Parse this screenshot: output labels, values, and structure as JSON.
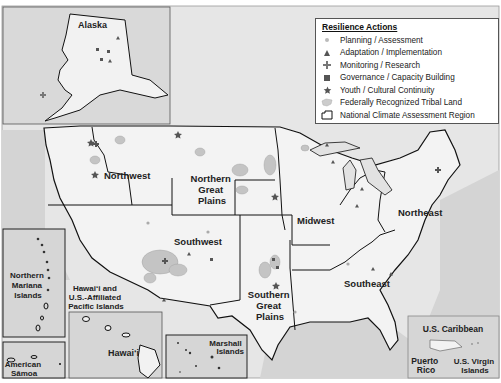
{
  "legend": {
    "title": "Resilience Actions",
    "items": [
      {
        "label": "Planning / Assessment",
        "icon": "circle-icon"
      },
      {
        "label": "Adaptation / Implementation",
        "icon": "triangle-icon"
      },
      {
        "label": "Monitoring / Research",
        "icon": "plus-icon"
      },
      {
        "label": "Governance / Capacity Building",
        "icon": "square-icon"
      },
      {
        "label": "Youth / Cultural Continuity",
        "icon": "star-icon"
      },
      {
        "label": "Federally Recognized Tribal Land",
        "icon": "tribal-land-icon"
      },
      {
        "label": "National Climate Assessment Region",
        "icon": "region-outline-icon"
      }
    ]
  },
  "regions": {
    "northwest": "Northwest",
    "northern_great_plains": [
      "Northern",
      "Great",
      "Plains"
    ],
    "midwest": "Midwest",
    "northeast": "Northeast",
    "southwest": "Southwest",
    "southern_great_plains": [
      "Southern",
      "Great",
      "Plains"
    ],
    "southeast": "Southeast"
  },
  "insets": {
    "alaska": "Alaska",
    "northern_mariana": [
      "Northern",
      "Mariana",
      "Islands"
    ],
    "american_samoa": [
      "American",
      "Sāmoa"
    ],
    "hawaii_pacific": [
      "Hawai‘i and",
      "U.S.-Affiliated",
      "Pacific Islands"
    ],
    "hawaii": "Hawai‘i",
    "marshall": [
      "Marshall",
      "Islands"
    ],
    "caribbean_title": "U.S. Caribbean",
    "puerto_rico": [
      "Puerto",
      "Rico"
    ],
    "virgin_islands": [
      "U.S. Virgin",
      "Islands"
    ]
  },
  "colors": {
    "land": "#f2f2f2",
    "water": "#d9d9d9",
    "inset_bg": "#d6d6d6",
    "border": "#111111",
    "tribal_land": "#bdbdbd",
    "marker": "#555555"
  }
}
